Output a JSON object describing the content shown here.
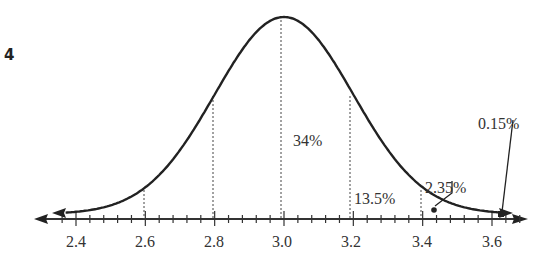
{
  "problem_number": "4",
  "chart_data": {
    "type": "line",
    "title": "",
    "subtitle": "Normal distribution (bell curve), mean 3.0, standard deviation 0.2",
    "xlabel": "",
    "ylabel": "",
    "mean": 3.0,
    "std": 0.2,
    "x_ticks": [
      "2.4",
      "2.6",
      "2.8",
      "3.0",
      "3.2",
      "3.4",
      "3.6"
    ],
    "x_tick_values": [
      2.4,
      2.6,
      2.8,
      3.0,
      3.2,
      3.4,
      3.6
    ],
    "minor_tick_step": 0.04,
    "xlim": [
      2.3,
      3.7
    ],
    "grid": false,
    "dashed_lines_at": [
      2.6,
      2.8,
      3.0,
      3.2,
      3.4
    ],
    "annotations": [
      {
        "text": "34%",
        "region": [
          3.0,
          3.2
        ]
      },
      {
        "text": "13.5%",
        "region": [
          3.2,
          3.4
        ]
      },
      {
        "text": "2.35%",
        "region": [
          3.4,
          3.6
        ],
        "pointer": true
      },
      {
        "text": "0.15%",
        "region": [
          3.6,
          null
        ],
        "pointer": true
      }
    ]
  },
  "labels": {
    "p34": "34%",
    "p135": "13.5%",
    "p235": "2.35%",
    "p015": "0.15%",
    "t24": "2.4",
    "t26": "2.6",
    "t28": "2.8",
    "t30": "3.0",
    "t32": "3.2",
    "t34": "3.4",
    "t36": "3.6"
  },
  "colors": {
    "curve": "#222222",
    "axis": "#333333",
    "dashed": "#444444",
    "text": "#333333"
  }
}
